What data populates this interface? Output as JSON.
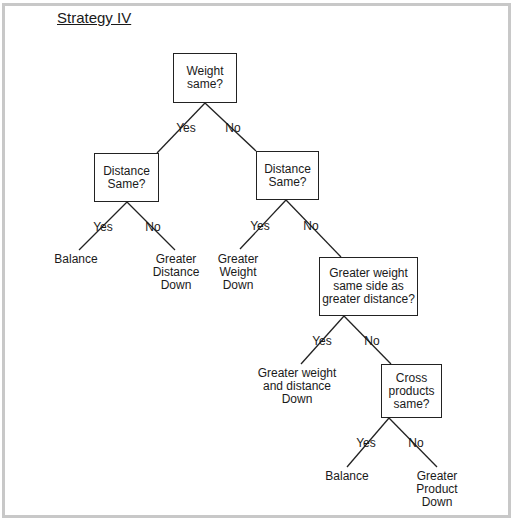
{
  "title": "Strategy IV",
  "nodes": {
    "n1": "Weight\nsame?",
    "n2": "Distance\nSame?",
    "n3": "Distance\nSame?",
    "n4": "Greater weight\nsame side as\ngreater distance?",
    "n5": "Cross\nproducts\nsame?"
  },
  "leaves": {
    "l1": "Balance",
    "l2": "Greater\nDistance\nDown",
    "l3": "Greater\nWeight\nDown",
    "l4": "Greater weight\nand distance\nDown",
    "l5": "Balance",
    "l6": "Greater\nProduct\nDown"
  },
  "edge_labels": {
    "yes": "Yes",
    "no": "No"
  }
}
